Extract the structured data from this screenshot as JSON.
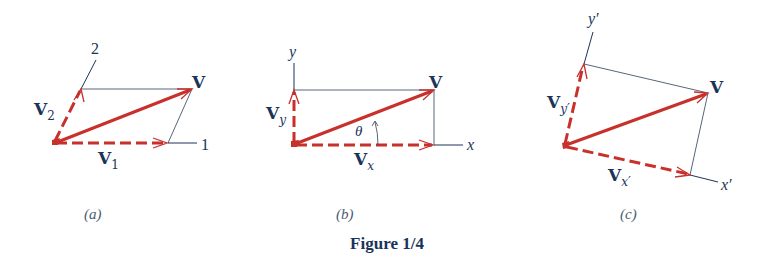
{
  "figure": {
    "caption": "Figure 1/4",
    "colors": {
      "vector": "#c8302c",
      "text": "#1c3358",
      "axis": "#1c3358"
    }
  },
  "panels": [
    {
      "id": "a",
      "sublabel": "(a)",
      "vector_label": "V",
      "components": [
        {
          "base": "V",
          "sub": "1"
        },
        {
          "base": "V",
          "sub": "2"
        }
      ],
      "axes": [
        {
          "label": "1"
        },
        {
          "label": "2"
        }
      ]
    },
    {
      "id": "b",
      "sublabel": "(b)",
      "vector_label": "V",
      "components": [
        {
          "base": "V",
          "sub": "x"
        },
        {
          "base": "V",
          "sub": "y"
        }
      ],
      "axes": [
        {
          "label": "x"
        },
        {
          "label": "y"
        }
      ],
      "angle_label": "θ"
    },
    {
      "id": "c",
      "sublabel": "(c)",
      "vector_label": "V",
      "components": [
        {
          "base": "V",
          "sub": "x′"
        },
        {
          "base": "V",
          "sub": "y′"
        }
      ],
      "axes": [
        {
          "label": "x′"
        },
        {
          "label": "y′"
        }
      ]
    }
  ]
}
